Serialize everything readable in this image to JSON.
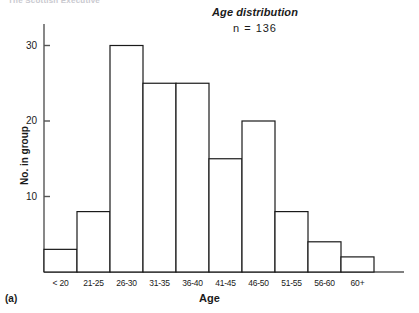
{
  "figure": {
    "running_head": "The Scottish Executive",
    "panel_label": "(a)"
  },
  "chart_data": {
    "type": "bar",
    "title": "Age distribution",
    "subtitle": "n  =  136",
    "n": 136,
    "xlabel": "Age",
    "ylabel": "No. in group",
    "categories": [
      "< 20",
      "21-25",
      "26-30",
      "31-35",
      "36-40",
      "41-45",
      "46-50",
      "51-55",
      "56-60",
      "60+"
    ],
    "values": [
      3,
      8,
      30,
      25,
      25,
      15,
      20,
      8,
      4,
      2
    ],
    "ylim": [
      0,
      32
    ],
    "yticks": [
      10,
      20,
      30
    ],
    "ytick_labels": [
      "10",
      "20",
      "30"
    ],
    "grid": false,
    "legend": "none",
    "bar_fill": "#ffffff",
    "bar_stroke": "#1a1a1a",
    "axis_color": "#555555"
  }
}
